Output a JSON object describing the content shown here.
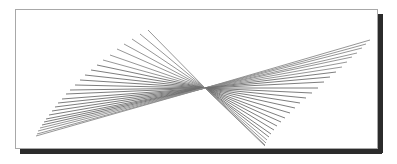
{
  "page": {
    "canvas_width": 397,
    "canvas_height": 164,
    "background_color": "#ffffff"
  },
  "frame": {
    "name": "picture-frame",
    "border_color": "#a8a8a8",
    "border_width": 1,
    "fill_color": "#ffffff",
    "x": 15,
    "y": 9,
    "width": 362,
    "height": 139,
    "shadow": {
      "name": "drop-shadow",
      "color": "#2b2b2b",
      "offset_x": 5,
      "offset_y": 5,
      "thickness": 5
    }
  },
  "chart_data": {
    "type": "line",
    "title": "",
    "subtitle": "",
    "xlabel": "",
    "ylabel": "",
    "grid": false,
    "legend": null,
    "xlim": [
      15,
      377
    ],
    "ylim": [
      9,
      148
    ],
    "stroke_color": "#8a8a8a",
    "stroke_color_dense": "#6e6e6e",
    "stroke_width": 0.9,
    "pivot": {
      "x": 205,
      "y": 88
    },
    "fans": [
      {
        "name": "left-fan",
        "line_count": 26,
        "pivot": {
          "x": 205,
          "y": 88
        },
        "spread_start": {
          "x": 148,
          "y": 30
        },
        "spread_end": {
          "x": 36,
          "y": 136
        },
        "tip_arc": [
          {
            "x": 148,
            "y": 30
          },
          {
            "x": 140,
            "y": 34
          },
          {
            "x": 132,
            "y": 39
          },
          {
            "x": 124,
            "y": 44
          },
          {
            "x": 117,
            "y": 49
          },
          {
            "x": 110,
            "y": 55
          },
          {
            "x": 103,
            "y": 60
          },
          {
            "x": 97,
            "y": 65
          },
          {
            "x": 91,
            "y": 70
          },
          {
            "x": 85,
            "y": 75
          },
          {
            "x": 80,
            "y": 80
          },
          {
            "x": 75,
            "y": 85
          },
          {
            "x": 70,
            "y": 90
          },
          {
            "x": 66,
            "y": 94
          },
          {
            "x": 62,
            "y": 99
          },
          {
            "x": 58,
            "y": 103
          },
          {
            "x": 55,
            "y": 107
          },
          {
            "x": 52,
            "y": 111
          },
          {
            "x": 49,
            "y": 115
          },
          {
            "x": 46,
            "y": 119
          },
          {
            "x": 44,
            "y": 122
          },
          {
            "x": 42,
            "y": 125
          },
          {
            "x": 40,
            "y": 128
          },
          {
            "x": 38,
            "y": 131
          },
          {
            "x": 37,
            "y": 134
          },
          {
            "x": 36,
            "y": 136
          }
        ]
      },
      {
        "name": "right-fan",
        "line_count": 26,
        "pivot": {
          "x": 205,
          "y": 88
        },
        "spread_start": {
          "x": 370,
          "y": 40
        },
        "spread_end": {
          "x": 265,
          "y": 146
        },
        "tip_arc": [
          {
            "x": 370,
            "y": 40
          },
          {
            "x": 366,
            "y": 44
          },
          {
            "x": 362,
            "y": 48
          },
          {
            "x": 357,
            "y": 53
          },
          {
            "x": 352,
            "y": 57
          },
          {
            "x": 347,
            "y": 62
          },
          {
            "x": 342,
            "y": 67
          },
          {
            "x": 336,
            "y": 72
          },
          {
            "x": 330,
            "y": 77
          },
          {
            "x": 324,
            "y": 82
          },
          {
            "x": 318,
            "y": 88
          },
          {
            "x": 312,
            "y": 93
          },
          {
            "x": 306,
            "y": 98
          },
          {
            "x": 300,
            "y": 103
          },
          {
            "x": 295,
            "y": 108
          },
          {
            "x": 290,
            "y": 113
          },
          {
            "x": 285,
            "y": 118
          },
          {
            "x": 281,
            "y": 122
          },
          {
            "x": 277,
            "y": 126
          },
          {
            "x": 274,
            "y": 130
          },
          {
            "x": 271,
            "y": 134
          },
          {
            "x": 269,
            "y": 137
          },
          {
            "x": 267,
            "y": 140
          },
          {
            "x": 266,
            "y": 143
          },
          {
            "x": 265,
            "y": 145
          },
          {
            "x": 265,
            "y": 146
          }
        ]
      }
    ]
  }
}
